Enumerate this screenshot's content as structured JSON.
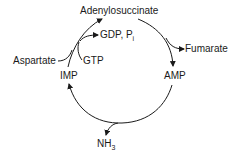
{
  "diagram": {
    "type": "metabolic-cycle",
    "nodes": {
      "adenylosuccinate": "Adenylosuccinate",
      "amp": "AMP",
      "imp": "IMP"
    },
    "side_inputs": {
      "aspartate": "Aspartate",
      "gtp": "GTP"
    },
    "side_outputs": {
      "gdp_pi": "GDP, P",
      "gdp_pi_sub": "i",
      "fumarate": "Fumarate",
      "nh3": "NH",
      "nh3_sub": "3"
    },
    "edges": [
      {
        "from": "IMP",
        "to": "Adenylosuccinate",
        "inputs": [
          "Aspartate",
          "GTP"
        ],
        "outputs": [
          "GDP, Pi"
        ]
      },
      {
        "from": "Adenylosuccinate",
        "to": "AMP",
        "outputs": [
          "Fumarate"
        ]
      },
      {
        "from": "AMP",
        "to": "IMP",
        "outputs": [
          "NH3"
        ]
      }
    ],
    "colors": {
      "stroke": "#1a1a1a",
      "background": "#ffffff"
    }
  }
}
